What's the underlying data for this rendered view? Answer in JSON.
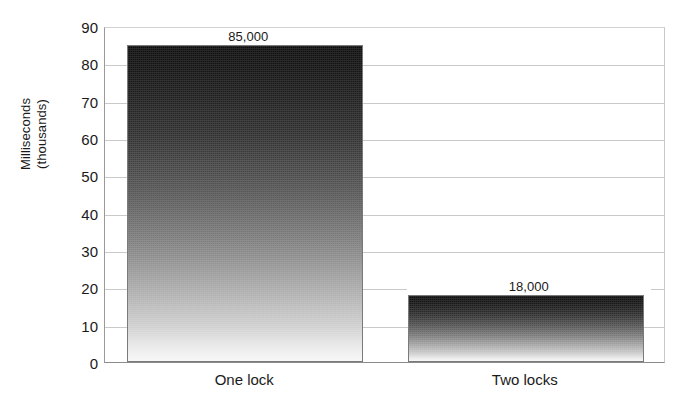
{
  "chart_data": {
    "type": "bar",
    "title": "",
    "xlabel": "",
    "ylabel": "Milliseconds\n(thousands)",
    "categories": [
      "One lock",
      "Two locks"
    ],
    "values": [
      85000,
      18000
    ],
    "value_labels": [
      "85,000",
      "18,000"
    ],
    "unit": "milliseconds",
    "value_scale": "thousands",
    "plotted_values_thousands": [
      85,
      18
    ],
    "ylim": [
      0,
      90
    ],
    "ytick_values": [
      0,
      10,
      20,
      30,
      40,
      50,
      60,
      70,
      80,
      90
    ],
    "ytick_labels": [
      "0",
      "10",
      "20",
      "30",
      "40",
      "50",
      "60",
      "70",
      "80",
      "90"
    ],
    "grid": "horizontal",
    "legend": "none",
    "series": [
      {
        "name": "Milliseconds (thousands)",
        "values": [
          85,
          18
        ],
        "fill": "vertical-gradient-black-to-white"
      }
    ],
    "colors": {
      "bar_top": "#0b0b0b",
      "bar_bottom": "#f7f7f7",
      "gridline": "#c9c9c9",
      "axis": "#8c8c8c",
      "text": "#1a1a1a",
      "background": "#ffffff"
    }
  },
  "axis": {
    "y_title_line1": "Milliseconds",
    "y_title_line2": "(thousands)"
  }
}
